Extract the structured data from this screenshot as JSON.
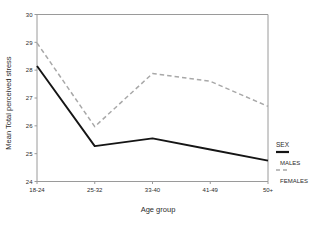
{
  "chart_data": {
    "type": "line",
    "title": "",
    "xlabel": "Age group",
    "ylabel": "Mean Total perceived stress",
    "categories": [
      "18-24",
      "25-32",
      "33-40",
      "41-49",
      "50+"
    ],
    "ylim": [
      24,
      30
    ],
    "yticks": [
      "24",
      "25",
      "26",
      "27",
      "28",
      "29",
      "30"
    ],
    "ytick_values": [
      24,
      25,
      26,
      27,
      28,
      29,
      30
    ],
    "grid": false,
    "legend_position": "right",
    "legend_title": "SEX",
    "series": [
      {
        "name": "MALES",
        "style": "solid",
        "color": "#151515",
        "values": [
          28.15,
          25.27,
          25.55,
          25.15,
          24.75
        ]
      },
      {
        "name": "FEMALES",
        "style": "dashed",
        "color": "#a8a8a8",
        "values": [
          28.98,
          25.97,
          27.88,
          27.6,
          26.7
        ]
      }
    ]
  },
  "legend": {
    "title": "SEX",
    "entries": [
      {
        "label": "MALES",
        "style": "solid",
        "color": "#151515"
      },
      {
        "label": "FEMALES",
        "style": "dashed",
        "color": "#a8a8a8"
      }
    ]
  },
  "axes": {
    "x_title": "Age group",
    "y_title": "Mean Total perceived stress",
    "frame_color": "#9a9a9a",
    "background": "#ffffff"
  }
}
